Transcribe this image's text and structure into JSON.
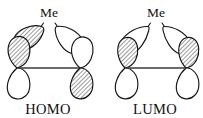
{
  "figure": {
    "background_color": "#ffffff",
    "line_color": "#141414",
    "bond_color": "#3a3a3a",
    "shaded_lobe_fill": "hatched-gray"
  },
  "diagrams": [
    {
      "id": "homo",
      "label": "HOMO",
      "substituent_label": "Me",
      "label_x": 48,
      "label_y": 113,
      "substituent_x": 50,
      "substituent_y": 15,
      "lobes": [
        {
          "name": "upper-left-lobe",
          "phase": "shaded"
        },
        {
          "name": "upper-right-lobe",
          "phase": "white"
        },
        {
          "name": "left-p-top-lobe",
          "phase": "shaded"
        },
        {
          "name": "left-p-bottom-lobe",
          "phase": "white"
        },
        {
          "name": "right-p-top-lobe",
          "phase": "white"
        },
        {
          "name": "right-p-bottom-lobe",
          "phase": "shaded"
        }
      ]
    },
    {
      "id": "lumo",
      "label": "LUMO",
      "substituent_label": "Me",
      "label_x": 155,
      "label_y": 113,
      "substituent_x": 156,
      "substituent_y": 15,
      "lobes": [
        {
          "name": "upper-left-lobe",
          "phase": "white"
        },
        {
          "name": "upper-right-lobe",
          "phase": "white"
        },
        {
          "name": "left-p-top-lobe",
          "phase": "shaded"
        },
        {
          "name": "left-p-bottom-lobe",
          "phase": "white"
        },
        {
          "name": "right-p-top-lobe",
          "phase": "shaded"
        },
        {
          "name": "right-p-bottom-lobe",
          "phase": "white"
        }
      ]
    }
  ]
}
